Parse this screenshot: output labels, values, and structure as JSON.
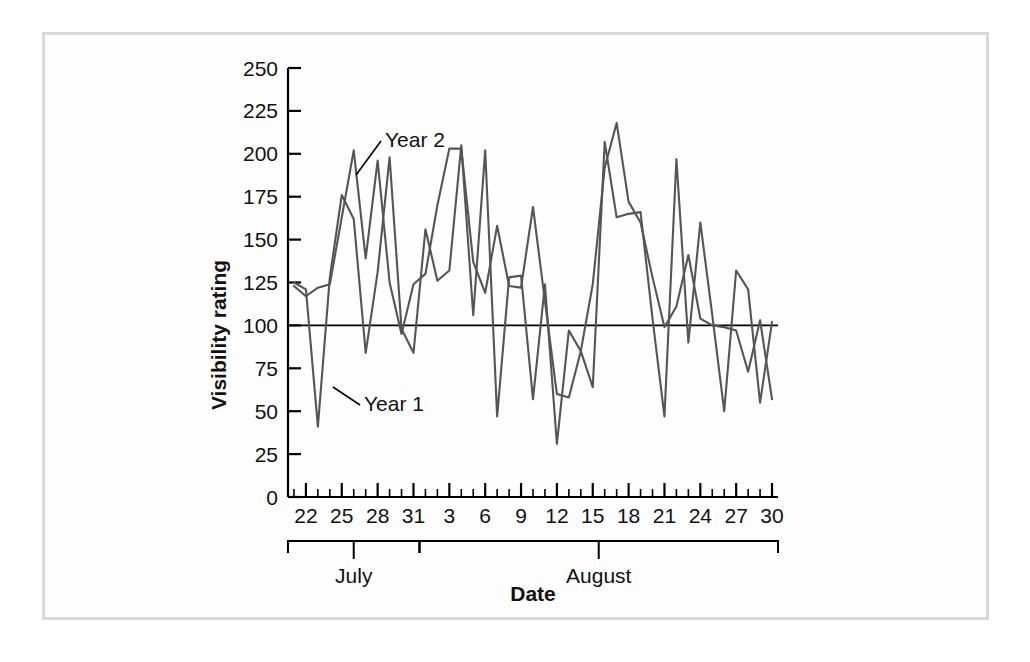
{
  "figure": {
    "background_color": "#ffffff",
    "frame_color": "#d9d9d9",
    "line_color": "#555555",
    "axis_color": "#000000"
  },
  "labels": {
    "y_axis_title": "Visibility rating",
    "x_axis_title": "Date",
    "series_1": "Year 1",
    "series_2": "Year 2",
    "group_july": "July",
    "group_august": "August"
  },
  "chart_data": {
    "type": "line",
    "title": "",
    "xlabel": "Date",
    "ylabel": "Visibility rating",
    "ylim": [
      0,
      250
    ],
    "yticks": [
      0,
      25,
      50,
      75,
      100,
      125,
      150,
      175,
      200,
      225,
      250
    ],
    "grid": false,
    "legend_position": "inline-annotation",
    "reference_line": {
      "value": 100,
      "orientation": "horizontal",
      "color": "#000000"
    },
    "x": [
      "July 21",
      "July 22",
      "July 23",
      "July 24",
      "July 25",
      "July 26",
      "July 27",
      "July 28",
      "July 29",
      "July 30",
      "July 31",
      "August 1",
      "August 2",
      "August 3",
      "August 4",
      "August 5",
      "August 6",
      "August 7",
      "August 8",
      "August 9",
      "August 10",
      "August 11",
      "August 12",
      "August 13",
      "August 14",
      "August 15",
      "August 16",
      "August 17",
      "August 18",
      "August 19",
      "August 20",
      "August 21",
      "August 22",
      "August 23",
      "August 24",
      "August 25",
      "August 26",
      "August 27",
      "August 28",
      "August 29",
      "August 30"
    ],
    "xtick_labels": [
      "22",
      "25",
      "28",
      "31",
      "3",
      "6",
      "9",
      "12",
      "15",
      "18",
      "21",
      "24",
      "27",
      "30"
    ],
    "xtick_label_positions": [
      "July 22",
      "July 25",
      "July 28",
      "July 31",
      "August 3",
      "August 6",
      "August 9",
      "August 12",
      "August 15",
      "August 18",
      "August 21",
      "August 24",
      "August 27",
      "August 30"
    ],
    "month_groups": [
      {
        "label": "July",
        "start": "July 21",
        "end": "July 31"
      },
      {
        "label": "August",
        "start": "August 1",
        "end": "August 30"
      }
    ],
    "series": [
      {
        "name": "Year 1",
        "values": [
          125,
          121,
          41,
          128,
          176,
          162,
          84,
          131,
          198,
          98,
          84,
          156,
          126,
          132,
          205,
          106,
          202,
          47,
          128,
          129,
          57,
          124,
          31,
          97,
          85,
          64,
          207,
          163,
          165,
          166,
          104,
          47,
          197,
          90,
          160,
          106,
          50,
          132,
          121,
          55,
          102
        ]
      },
      {
        "name": "Year 2",
        "values": [
          123,
          117,
          122,
          124,
          163,
          202,
          139,
          196,
          125,
          95,
          124,
          130,
          170,
          203,
          203,
          137,
          119,
          158,
          123,
          122,
          169,
          114,
          60,
          58,
          85,
          124,
          192,
          218,
          172,
          160,
          128,
          99,
          111,
          141,
          104,
          100,
          99,
          97,
          73,
          103,
          57
        ]
      }
    ]
  }
}
